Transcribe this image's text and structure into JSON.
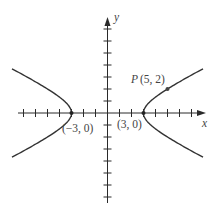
{
  "diagram": {
    "type": "hyperbola",
    "equation": "x^2/9 - y^2/(9/4) = 1",
    "a": 3,
    "b": 1.5,
    "axes": {
      "x_label": "x",
      "y_label": "y",
      "x_range": [
        -8,
        8
      ],
      "y_range": [
        -8,
        8
      ],
      "tick_step": 1
    },
    "vertices": [
      {
        "x": -3,
        "y": 0,
        "label": "(−3, 0)"
      },
      {
        "x": 3,
        "y": 0,
        "label": "(3, 0)"
      }
    ],
    "point": {
      "name": "P",
      "x": 5,
      "y": 2,
      "label_name": "P",
      "label_coords": "(5, 2)"
    },
    "colors": {
      "axis": "#2a2a2a",
      "curve": "#333333",
      "text": "#444444",
      "background": "#ffffff"
    }
  },
  "layout": {
    "origin_px": [
      107.5,
      113
    ],
    "unit_px": 12,
    "x_axis_px": [
      18,
      206
    ],
    "y_axis_px": [
      17,
      203
    ],
    "curve_x_extent": 7.96
  }
}
